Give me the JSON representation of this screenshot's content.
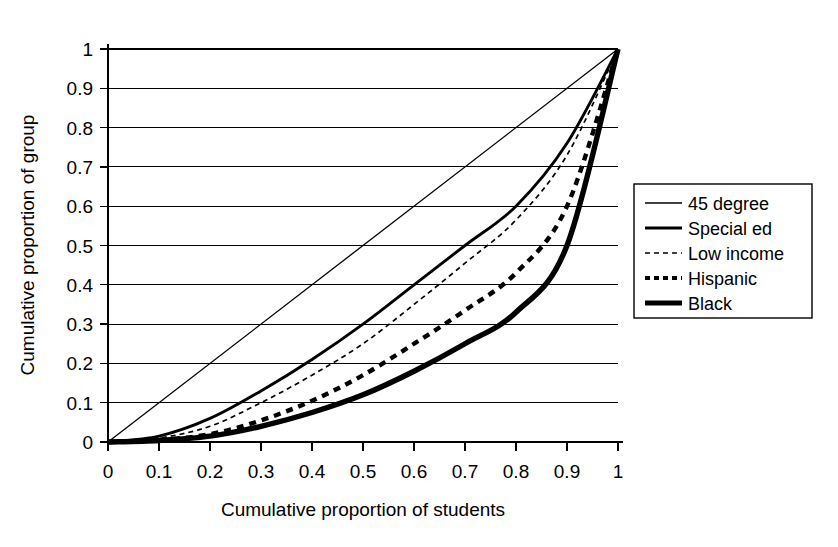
{
  "chart_data": {
    "type": "line",
    "title": "",
    "xlabel": "Cumulative proportion of students",
    "ylabel": "Cumulative proportion of group",
    "xlim": [
      0,
      1
    ],
    "ylim": [
      0,
      1
    ],
    "grid": "horizontal",
    "legend_position": "right",
    "xticks": [
      "0",
      "0.1",
      "0.2",
      "0.3",
      "0.4",
      "0.5",
      "0.6",
      "0.7",
      "0.8",
      "0.9",
      "1"
    ],
    "yticks": [
      "0",
      "0.1",
      "0.2",
      "0.3",
      "0.4",
      "0.5",
      "0.6",
      "0.7",
      "0.8",
      "0.9",
      "1"
    ],
    "x": [
      0,
      0.1,
      0.2,
      0.3,
      0.4,
      0.5,
      0.6,
      0.7,
      0.8,
      0.9,
      1
    ],
    "series": [
      {
        "name": "45 degree",
        "style": "thin-solid",
        "values": [
          0,
          0.1,
          0.2,
          0.3,
          0.4,
          0.5,
          0.6,
          0.7,
          0.8,
          0.9,
          1
        ]
      },
      {
        "name": "Special ed",
        "style": "thick-solid",
        "values": [
          0,
          0.015,
          0.06,
          0.13,
          0.21,
          0.3,
          0.4,
          0.5,
          0.6,
          0.76,
          1
        ]
      },
      {
        "name": "Low income",
        "style": "fine-dashed",
        "values": [
          0,
          0.01,
          0.04,
          0.1,
          0.17,
          0.25,
          0.35,
          0.455,
          0.565,
          0.73,
          1
        ]
      },
      {
        "name": "Hispanic",
        "style": "bold-dashed",
        "values": [
          0,
          0.005,
          0.02,
          0.055,
          0.105,
          0.17,
          0.25,
          0.335,
          0.43,
          0.6,
          1
        ]
      },
      {
        "name": "Black",
        "style": "heavy-solid",
        "values": [
          0,
          0.004,
          0.015,
          0.04,
          0.075,
          0.12,
          0.18,
          0.25,
          0.33,
          0.5,
          1
        ]
      }
    ]
  },
  "axes": {
    "x_title": "Cumulative proportion of students",
    "y_title": "Cumulative proportion of group",
    "x_tick_labels": [
      "0",
      "0.1",
      "0.2",
      "0.3",
      "0.4",
      "0.5",
      "0.6",
      "0.7",
      "0.8",
      "0.9",
      "1"
    ],
    "y_tick_labels": [
      "1",
      "0.9",
      "0.8",
      "0.7",
      "0.6",
      "0.5",
      "0.4",
      "0.3",
      "0.2",
      "0.1",
      "0"
    ]
  },
  "legend": {
    "items": [
      {
        "label": "45 degree"
      },
      {
        "label": "Special ed"
      },
      {
        "label": "Low income"
      },
      {
        "label": "Hispanic"
      },
      {
        "label": "Black"
      }
    ]
  },
  "colors": {
    "ink": "#000000",
    "background": "#ffffff"
  }
}
